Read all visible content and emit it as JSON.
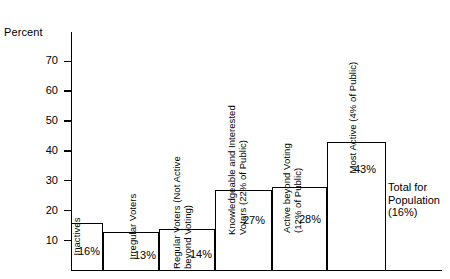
{
  "chart_data": {
    "type": "bar",
    "title": "",
    "xlabel": "",
    "ylabel": "Percent",
    "ylim": [
      0,
      75
    ],
    "grid": false,
    "legend": "none",
    "yticks": [
      70,
      60,
      50,
      40,
      30,
      20,
      10
    ],
    "categories": [
      "Inactives",
      "Irregular Voters",
      "Regular Voters (Not Active\nbeyond Voting)",
      "Knowledgeable and Interested\nVoters (22% of Public)",
      "Active beyond Voting\n(12% of Public)",
      "Most Active (4% of Public)"
    ],
    "values": [
      16,
      13,
      14,
      27,
      28,
      43
    ],
    "value_labels": [
      "16%",
      "13%",
      "14%",
      "27%",
      "28%",
      "43%"
    ],
    "annotation": "Total  for\nPopulation\n(16%)"
  },
  "axis": {
    "title": "Percent",
    "ticks": [
      "70",
      "60",
      "50",
      "40",
      "30",
      "20",
      "10"
    ]
  }
}
